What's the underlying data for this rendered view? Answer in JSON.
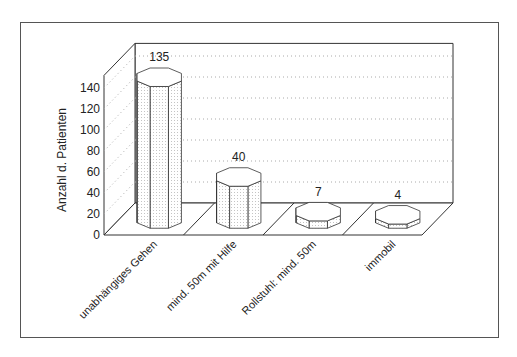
{
  "chart_data": {
    "type": "bar",
    "style": "3d-octagonal-columns",
    "title": "",
    "xlabel": "",
    "ylabel": "Anzahl d. Patienten",
    "categories": [
      "unabhängiges Gehen",
      "mind. 50m mit Hilfe",
      "Rollstuhl: mind. 50m",
      "immobil"
    ],
    "values": [
      135,
      40,
      7,
      4
    ],
    "data_labels": [
      "135",
      "40",
      "7",
      "4"
    ],
    "ylim": [
      0,
      140
    ],
    "yticks": [
      0,
      20,
      40,
      60,
      80,
      100,
      120,
      140
    ],
    "grid": true,
    "grid_style": "dotted",
    "legend": null
  },
  "colors": {
    "line": "#333333",
    "grid": "#aaaaaa",
    "bar_fill": "#ffffff",
    "bar_hatch": "#bbbbbb",
    "frame": "#555555"
  }
}
